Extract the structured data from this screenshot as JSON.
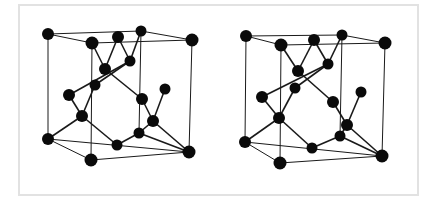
{
  "figure": {
    "colors": {
      "atom": "#0a0a0a",
      "bond": "#1a1a1a",
      "frame": "#e2e2e2",
      "background": "#ffffff"
    },
    "structures": [
      {
        "id": "left",
        "atoms": [
          {
            "id": "a1",
            "x": 48,
            "y": 34,
            "r": 6
          },
          {
            "id": "a2",
            "x": 92,
            "y": 43,
            "r": 6.5
          },
          {
            "id": "a3",
            "x": 118,
            "y": 37,
            "r": 6
          },
          {
            "id": "a4",
            "x": 141,
            "y": 31,
            "r": 5.5
          },
          {
            "id": "a5",
            "x": 192,
            "y": 40,
            "r": 6.5
          },
          {
            "id": "a6",
            "x": 105,
            "y": 69,
            "r": 6
          },
          {
            "id": "a7",
            "x": 130,
            "y": 61,
            "r": 5.5
          },
          {
            "id": "a8",
            "x": 95,
            "y": 85,
            "r": 5.5
          },
          {
            "id": "a9",
            "x": 69,
            "y": 95,
            "r": 6
          },
          {
            "id": "a10",
            "x": 165,
            "y": 89,
            "r": 5.5
          },
          {
            "id": "a11",
            "x": 142,
            "y": 99,
            "r": 6
          },
          {
            "id": "a12",
            "x": 82,
            "y": 116,
            "r": 6
          },
          {
            "id": "a13",
            "x": 153,
            "y": 121,
            "r": 6
          },
          {
            "id": "a14",
            "x": 139,
            "y": 133,
            "r": 5.5
          },
          {
            "id": "a15",
            "x": 48,
            "y": 139,
            "r": 6
          },
          {
            "id": "a16",
            "x": 117,
            "y": 145,
            "r": 5.5
          },
          {
            "id": "a17",
            "x": 91,
            "y": 160,
            "r": 6.5
          },
          {
            "id": "a18",
            "x": 189,
            "y": 152,
            "r": 6.5
          }
        ],
        "cell_edges": [
          [
            "a1",
            "a4"
          ],
          [
            "a2",
            "a5"
          ],
          [
            "a1",
            "a2"
          ],
          [
            "a4",
            "a5"
          ],
          [
            "a15",
            "a18"
          ],
          [
            "a17",
            "a18"
          ],
          [
            "a15",
            "a17"
          ],
          [
            "a1",
            "a15"
          ],
          [
            "a2",
            "a17"
          ],
          [
            "a5",
            "a18"
          ],
          [
            "a4",
            "a14"
          ]
        ],
        "bonds": [
          [
            "a2",
            "a6"
          ],
          [
            "a3",
            "a6"
          ],
          [
            "a3",
            "a7"
          ],
          [
            "a4",
            "a7"
          ],
          [
            "a6",
            "a11"
          ],
          [
            "a7",
            "a9"
          ],
          [
            "a8",
            "a12"
          ],
          [
            "a9",
            "a12"
          ],
          [
            "a10",
            "a13"
          ],
          [
            "a11",
            "a13"
          ],
          [
            "a12",
            "a15"
          ],
          [
            "a12",
            "a16"
          ],
          [
            "a16",
            "a14"
          ],
          [
            "a14",
            "a13"
          ],
          [
            "a13",
            "a18"
          ],
          [
            "a14",
            "a18"
          ],
          [
            "a7",
            "a8"
          ]
        ]
      },
      {
        "id": "right",
        "atoms": [
          {
            "id": "b1",
            "x": 246,
            "y": 36,
            "r": 6
          },
          {
            "id": "b2",
            "x": 281,
            "y": 45,
            "r": 6.5
          },
          {
            "id": "b3",
            "x": 314,
            "y": 40,
            "r": 6
          },
          {
            "id": "b4",
            "x": 342,
            "y": 35,
            "r": 5.5
          },
          {
            "id": "b5",
            "x": 385,
            "y": 43,
            "r": 6.5
          },
          {
            "id": "b6",
            "x": 298,
            "y": 71,
            "r": 6
          },
          {
            "id": "b7",
            "x": 328,
            "y": 64,
            "r": 5.5
          },
          {
            "id": "b8",
            "x": 295,
            "y": 88,
            "r": 5.5
          },
          {
            "id": "b9",
            "x": 262,
            "y": 97,
            "r": 6
          },
          {
            "id": "b10",
            "x": 361,
            "y": 92,
            "r": 5.5
          },
          {
            "id": "b11",
            "x": 333,
            "y": 102,
            "r": 6
          },
          {
            "id": "b12",
            "x": 279,
            "y": 118,
            "r": 6
          },
          {
            "id": "b13",
            "x": 347,
            "y": 125,
            "r": 6
          },
          {
            "id": "b14",
            "x": 340,
            "y": 136,
            "r": 5.5
          },
          {
            "id": "b15",
            "x": 245,
            "y": 142,
            "r": 6
          },
          {
            "id": "b16",
            "x": 312,
            "y": 148,
            "r": 5.5
          },
          {
            "id": "b17",
            "x": 280,
            "y": 163,
            "r": 6.5
          },
          {
            "id": "b18",
            "x": 382,
            "y": 156,
            "r": 6.5
          }
        ],
        "cell_edges": [
          [
            "b1",
            "b4"
          ],
          [
            "b2",
            "b5"
          ],
          [
            "b1",
            "b2"
          ],
          [
            "b4",
            "b5"
          ],
          [
            "b15",
            "b18"
          ],
          [
            "b17",
            "b18"
          ],
          [
            "b15",
            "b17"
          ],
          [
            "b1",
            "b15"
          ],
          [
            "b2",
            "b17"
          ],
          [
            "b5",
            "b18"
          ],
          [
            "b4",
            "b14"
          ]
        ],
        "bonds": [
          [
            "b2",
            "b6"
          ],
          [
            "b3",
            "b6"
          ],
          [
            "b3",
            "b7"
          ],
          [
            "b4",
            "b7"
          ],
          [
            "b6",
            "b11"
          ],
          [
            "b7",
            "b9"
          ],
          [
            "b8",
            "b12"
          ],
          [
            "b9",
            "b12"
          ],
          [
            "b10",
            "b13"
          ],
          [
            "b11",
            "b13"
          ],
          [
            "b12",
            "b15"
          ],
          [
            "b12",
            "b16"
          ],
          [
            "b16",
            "b14"
          ],
          [
            "b14",
            "b13"
          ],
          [
            "b13",
            "b18"
          ],
          [
            "b14",
            "b18"
          ],
          [
            "b7",
            "b8"
          ]
        ]
      }
    ]
  }
}
